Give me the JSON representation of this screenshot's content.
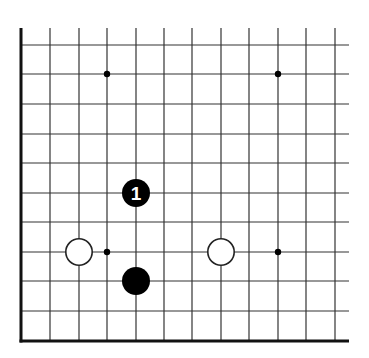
{
  "diagram": {
    "type": "go-board-corner",
    "colors": {
      "background": "#ffffff",
      "line": "#333333",
      "edge": "#111111",
      "black_stone": "#000000",
      "white_stone": "#ffffff",
      "label_on_black": "#ffffff"
    },
    "grid": {
      "columns_x": [
        22,
        50,
        79,
        107,
        136,
        164,
        192,
        221,
        249,
        278,
        306,
        335
      ],
      "rows_y": [
        45,
        74,
        104,
        134,
        163,
        193,
        222,
        252,
        281,
        311
      ],
      "top_y": 28,
      "right_x": 349,
      "bottom_edge_y": 341,
      "left_edge_x": 21
    },
    "star_points": [
      {
        "x": 107,
        "y": 74
      },
      {
        "x": 278,
        "y": 74
      },
      {
        "x": 107,
        "y": 252
      },
      {
        "x": 278,
        "y": 252
      }
    ],
    "stones": [
      {
        "color": "black",
        "x": 136,
        "y": 193,
        "label": "1"
      },
      {
        "color": "black",
        "x": 136,
        "y": 281,
        "label": ""
      },
      {
        "color": "white",
        "x": 79,
        "y": 252,
        "label": ""
      },
      {
        "color": "white",
        "x": 221,
        "y": 252,
        "label": ""
      }
    ],
    "stone_radius": 14
  }
}
